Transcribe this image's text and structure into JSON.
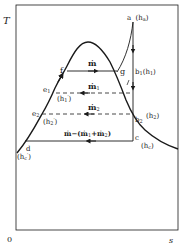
{
  "diagram": {
    "type": "T-s diagram",
    "axes": {
      "y_label": "T",
      "x_label": "s",
      "origin": "0"
    },
    "points": {
      "a": {
        "name": "a",
        "enthalpy": "(h",
        "sub": "a",
        "close": ")"
      },
      "b1": {
        "name": "b",
        "sub": "1",
        "enthalpy": "(h",
        "esub": "1",
        "close": ")"
      },
      "b2": {
        "name": "b",
        "sub": "2",
        "enthalpy": "(h",
        "esub": "2",
        "close": ")"
      },
      "c": {
        "name": "c",
        "enthalpy": "(h",
        "esub": "c",
        "close": ")"
      },
      "d": {
        "name": "d",
        "enthalpy": "(h",
        "esub": "c",
        "prime": "′",
        "close": ")"
      },
      "e1": {
        "name": "e",
        "sub": "1",
        "enthalpy": "(h",
        "esub": "1",
        "prime": "′",
        "close": ")"
      },
      "e2": {
        "name": "e",
        "sub": "2",
        "enthalpy": "(h",
        "esub": "2",
        "prime": "′",
        "close": ")"
      },
      "f": {
        "name": "f"
      },
      "g": {
        "name": "g"
      }
    },
    "flows": {
      "main": "ṁ",
      "m1": "ṁ",
      "m1_sub": "1",
      "m2": "ṁ",
      "m2_sub": "2",
      "remainder": "ṁ−(ṁ",
      "remainder_sub1": "1",
      "remainder_plus": "+ṁ",
      "remainder_sub2": "2",
      "remainder_close": ")"
    },
    "colors": {
      "line": "#1a1a1a",
      "background": "#ffffff"
    }
  }
}
